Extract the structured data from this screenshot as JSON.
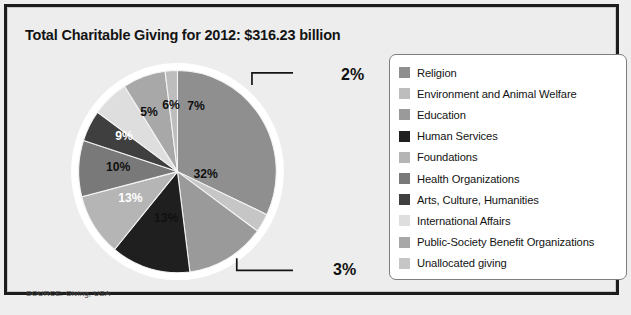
{
  "chart_data": {
    "type": "pie",
    "title": "Total Charitable Giving for 2012: $316.23 billion",
    "source": "SOURCE: Giving, USA",
    "unit": "percent",
    "total_label": "$316.23 billion",
    "year": "2012",
    "legend_position": "right",
    "categories": [
      "Religion",
      "Environment and Animal Welfare",
      "Education",
      "Human Services",
      "Foundations",
      "Health Organizations",
      "Arts, Culture, Humanities",
      "International Affairs",
      "Public-Society Benefit Organizations",
      "Unallocated giving"
    ],
    "values": [
      32,
      2,
      13,
      13,
      10,
      9,
      5,
      6,
      7,
      3
    ],
    "colors": [
      "#8f8f8f",
      "#bdbdbd",
      "#9a9a9a",
      "#1f1f1f",
      "#b5b5b5",
      "#797979",
      "#3f3f3f",
      "#dedede",
      "#a8a8a8",
      "#c6c6c6"
    ],
    "slices": [
      {
        "label": "32%",
        "value": 32,
        "category": "Religion",
        "color": "#8f8f8f",
        "label_color": "dark",
        "label_x": 151,
        "label_y": 123,
        "start_deg": 0,
        "end_deg": 115.2
      },
      {
        "label": "3%",
        "value": 3,
        "category": "Unallocated giving",
        "color": "#c6c6c6",
        "label_color": "dark",
        "callout": true,
        "start_deg": 115.2,
        "end_deg": 126.0
      },
      {
        "label": "13%",
        "value": 13,
        "category": "Education",
        "color": "#9a9a9a",
        "label_color": "dark",
        "label_x": 99,
        "label_y": 180,
        "start_deg": 126.0,
        "end_deg": 172.8
      },
      {
        "label": "13%",
        "value": 13,
        "category": "Human Services",
        "color": "#1f1f1f",
        "label_color": "light",
        "label_x": 52,
        "label_y": 154,
        "start_deg": 172.8,
        "end_deg": 219.6
      },
      {
        "label": "10%",
        "value": 10,
        "category": "Foundations",
        "color": "#b5b5b5",
        "label_color": "dark",
        "label_x": 36,
        "label_y": 113,
        "start_deg": 219.6,
        "end_deg": 255.6
      },
      {
        "label": "9%",
        "value": 9,
        "category": "Health Organizations",
        "color": "#797979",
        "label_color": "light",
        "label_x": 48,
        "label_y": 72,
        "start_deg": 255.6,
        "end_deg": 288.0
      },
      {
        "label": "5%",
        "value": 5,
        "category": "Arts, Culture, Humanities",
        "color": "#3f3f3f",
        "label_color": "dark",
        "label_x": 81,
        "label_y": 41,
        "start_deg": 288.0,
        "end_deg": 306.0
      },
      {
        "label": "6%",
        "value": 6,
        "category": "International Affairs",
        "color": "#dedede",
        "label_color": "dark",
        "label_x": 110,
        "label_y": 32,
        "start_deg": 306.0,
        "end_deg": 327.6
      },
      {
        "label": "7%",
        "value": 7,
        "category": "Public-Society Benefit Organizations",
        "color": "#a8a8a8",
        "label_color": "dark",
        "label_x": 143,
        "label_y": 33,
        "start_deg": 327.6,
        "end_deg": 352.8
      },
      {
        "label": "2%",
        "value": 2,
        "category": "Environment and Animal Welfare",
        "color": "#bdbdbd",
        "label_color": "dark",
        "callout": true,
        "start_deg": 352.8,
        "end_deg": 360
      }
    ],
    "callouts": [
      {
        "label": "2%",
        "text_x": 234,
        "text_y": 16
      },
      {
        "label": "3%",
        "text_x": 234,
        "text_y": 218
      }
    ]
  },
  "legend": {
    "items": [
      {
        "label": "Religion",
        "color": "#8f8f8f"
      },
      {
        "label": "Environment and Animal Welfare",
        "color": "#bdbdbd"
      },
      {
        "label": "Education",
        "color": "#9a9a9a"
      },
      {
        "label": "Human Services",
        "color": "#1f1f1f"
      },
      {
        "label": "Foundations",
        "color": "#b5b5b5"
      },
      {
        "label": "Health Organizations",
        "color": "#797979"
      },
      {
        "label": "Arts, Culture, Humanities",
        "color": "#3f3f3f"
      },
      {
        "label": "International Affairs",
        "color": "#dedede"
      },
      {
        "label": "Public-Society Benefit Organizations",
        "color": "#a8a8a8"
      },
      {
        "label": "Unallocated giving",
        "color": "#c6c6c6"
      }
    ]
  }
}
